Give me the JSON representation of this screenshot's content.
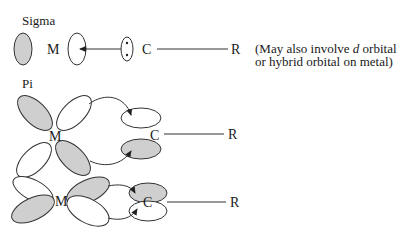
{
  "diagram": {
    "sections": [
      {
        "id": "sigma",
        "title": "Sigma",
        "metal_label": "M",
        "carbon_label": "C",
        "substituent_label": "R",
        "note_line1_pre": "(May also involve ",
        "note_line1_italic": "d",
        "note_line1_post": " orbital",
        "note_line2": "or hybrid orbital on metal)"
      },
      {
        "id": "pi",
        "title": "Pi",
        "metal_label": "M",
        "carbon_label": "C",
        "substituent_label": "R"
      },
      {
        "id": "pi-delta",
        "metal_label": "M",
        "carbon_label": "C",
        "substituent_label": "R"
      }
    ],
    "colors": {
      "shaded_lobe": "#cfcfcf",
      "outline": "#333333",
      "background": "#ffffff"
    }
  }
}
